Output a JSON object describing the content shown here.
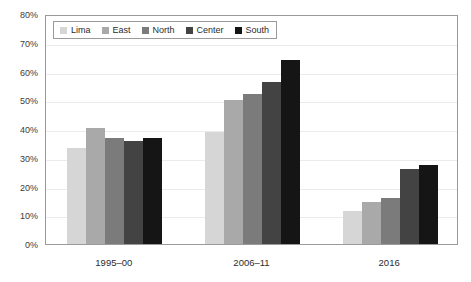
{
  "chart_data": {
    "type": "bar",
    "title": "",
    "subtitle": "",
    "xlabel": "",
    "ylabel": "",
    "categories": [
      "1995–00",
      "2006–11",
      "2016"
    ],
    "series": [
      {
        "name": "Lima",
        "color": "#d6d6d6",
        "values": [
          33.5,
          39.0,
          11.5
        ]
      },
      {
        "name": "East",
        "color": "#a9a9a9",
        "values": [
          40.5,
          50.0,
          14.5
        ]
      },
      {
        "name": "North",
        "color": "#7b7b7b",
        "values": [
          37.0,
          52.3,
          16.0
        ]
      },
      {
        "name": "Center",
        "color": "#434343",
        "values": [
          36.0,
          56.3,
          26.0
        ]
      },
      {
        "name": "South",
        "color": "#151515",
        "values": [
          37.0,
          64.0,
          27.5
        ]
      }
    ],
    "ylim": [
      0,
      80
    ],
    "y_ticks": [
      0,
      10,
      20,
      30,
      40,
      50,
      60,
      70,
      80
    ],
    "y_tick_labels": [
      "0%",
      "10%",
      "20%",
      "30%",
      "40%",
      "50%",
      "60%",
      "70%",
      "80%"
    ],
    "y_tick_suffix": "%",
    "grid": true,
    "grid_color": "#ebebeb",
    "legend_position": "top-left",
    "plot_border_color": "#9a9a9a",
    "background_color": "#ffffff"
  },
  "legend": {
    "items": [
      {
        "label": "Lima",
        "color": "#d6d6d6"
      },
      {
        "label": "East",
        "color": "#a9a9a9"
      },
      {
        "label": "North",
        "color": "#7b7b7b"
      },
      {
        "label": "Center",
        "color": "#434343"
      },
      {
        "label": "South",
        "color": "#151515"
      }
    ]
  }
}
